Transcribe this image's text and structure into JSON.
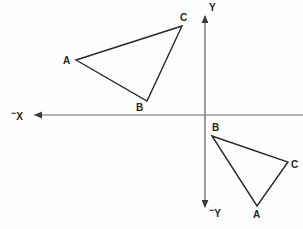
{
  "figure": {
    "kind": "geometry-diagram",
    "width": 303,
    "height": 229,
    "background_color": "#fefefe",
    "stroke_color": "#262626",
    "axis_color": "#555555"
  },
  "axes": {
    "origin": {
      "x": 205,
      "y": 115
    },
    "x_axis": {
      "name": "horizontal-axis",
      "from_x": 34,
      "to_x": 303,
      "y": 115,
      "arrow_end": "left"
    },
    "y_axis": {
      "name": "vertical-axis",
      "x": 205,
      "from_y": 16,
      "to_y": 207,
      "arrow_end": "both"
    },
    "labels": {
      "y_positive": "Y",
      "y_negative_sign": "−",
      "y_negative": "Y",
      "x_negative_sign": "−",
      "x_negative": "X"
    }
  },
  "chart_data": {
    "type": "scatter",
    "title": "",
    "xlabel": "X",
    "ylabel": "Y",
    "shapes": [
      {
        "name": "triangle-preimage",
        "quadrant": "II",
        "closed": true,
        "vertices": [
          {
            "label": "A",
            "x": 76,
            "y": 60,
            "label_x": 63,
            "label_y": 56
          },
          {
            "label": "B",
            "x": 147,
            "y": 101,
            "label_x": 136,
            "label_y": 103
          },
          {
            "label": "C",
            "x": 182,
            "y": 26,
            "label_x": 180,
            "label_y": 13
          }
        ]
      },
      {
        "name": "triangle-image",
        "quadrant": "IV",
        "closed": true,
        "vertices": [
          {
            "label": "B",
            "x": 212,
            "y": 136,
            "label_x": 212,
            "label_y": 123
          },
          {
            "label": "C",
            "x": 288,
            "y": 162,
            "label_x": 291,
            "label_y": 160
          },
          {
            "label": "A",
            "x": 257,
            "y": 206,
            "label_x": 253,
            "label_y": 210
          }
        ]
      }
    ]
  }
}
